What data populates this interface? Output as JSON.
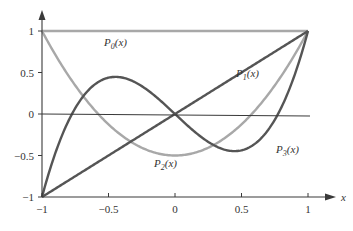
{
  "chart_data": {
    "type": "line",
    "title": "",
    "xlabel": "x",
    "ylabel": "",
    "xlim": [
      -1,
      1
    ],
    "ylim": [
      -1,
      1
    ],
    "grid": false,
    "x_ticks": [
      "-1",
      "-0.5",
      "0",
      "0.5",
      "1"
    ],
    "y_ticks": [
      "1",
      "0.5",
      "0",
      "-0.5",
      "-1"
    ],
    "x": [
      -1,
      -0.75,
      -0.5,
      -0.25,
      0,
      0.25,
      0.5,
      0.75,
      1
    ],
    "series": [
      {
        "name": "P0(x)",
        "label_sub": "0",
        "color": "#a8a8a8",
        "values": [
          1,
          1,
          1,
          1,
          1,
          1,
          1,
          1,
          1
        ]
      },
      {
        "name": "P1(x)",
        "label_sub": "1",
        "color": "#555555",
        "values": [
          -1,
          -0.75,
          -0.5,
          -0.25,
          0,
          0.25,
          0.5,
          0.75,
          1
        ]
      },
      {
        "name": "P2(x)",
        "label_sub": "2",
        "color": "#a8a8a8",
        "values": [
          1,
          0.344,
          -0.125,
          -0.406,
          -0.5,
          -0.406,
          -0.125,
          0.344,
          1
        ]
      },
      {
        "name": "P3(x)",
        "label_sub": "3",
        "color": "#555555",
        "values": [
          -1,
          0.078,
          0.438,
          0.336,
          0,
          -0.336,
          -0.438,
          -0.078,
          1
        ]
      }
    ],
    "annotations": [
      "P0(x)",
      "P1(x)",
      "P2(x)",
      "P3(x)"
    ]
  },
  "labels": {
    "x_axis": "x",
    "xt": [
      "−1",
      "−0.5",
      "0",
      "0.5",
      "1"
    ],
    "yt": [
      "1",
      "0.5",
      "0",
      "−0.5",
      "−1"
    ],
    "p": "P",
    "x_arg": "(x)",
    "subs": [
      "0",
      "1",
      "2",
      "3"
    ]
  }
}
